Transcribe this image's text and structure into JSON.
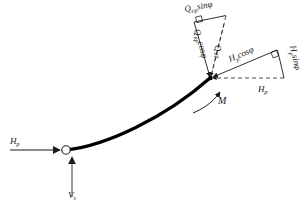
{
  "figure": {
    "type": "free-body-diagram",
    "background_color": "#ffffff",
    "line_color": "#1a1a1a",
    "thin_line_color": "#555555",
    "curve_color": "#000000"
  },
  "labels": {
    "q_tip_sin": {
      "base": "Q",
      "sub": "tip",
      "suffix": "sinφ",
      "full": "Q_tip sinφ"
    },
    "q_tip_cos": {
      "base": "Q",
      "sub": "tip",
      "suffix": "cosφ",
      "full": "Q_tip cosφ"
    },
    "q_tip": {
      "base": "Q",
      "sub": "tip",
      "suffix": "",
      "full": "Q_tip"
    },
    "h_p_cos": {
      "base": "H",
      "sub": "p",
      "suffix": "cosφ",
      "full": "H_p cosφ"
    },
    "h_p_sin": {
      "base": "H",
      "sub": "p",
      "suffix": "sinφ",
      "full": "H_p sinφ"
    },
    "h_p_tip": {
      "base": "H",
      "sub": "p",
      "suffix": "",
      "full": "H_p"
    },
    "h_p_head": {
      "base": "H",
      "sub": "p",
      "suffix": "",
      "full": "H_p"
    },
    "v_s": {
      "base": "V",
      "sub": "s",
      "suffix": "",
      "full": "V_s"
    },
    "moment": {
      "base": "M",
      "sub": "",
      "suffix": "",
      "full": "M"
    }
  },
  "geometry": {
    "pile_head_node": {
      "x": 66,
      "y": 150,
      "marker": "open-circle"
    },
    "pile_tip_node": {
      "x": 210,
      "y": 78,
      "marker": "filled-dot"
    },
    "curve_path": "M 66 150 C 105 146 165 118 210 78",
    "angle_symbol": "φ"
  },
  "vectors": [
    {
      "name": "q-tip-resultant",
      "from": [
        194,
        22
      ],
      "to": [
        210,
        78
      ],
      "style": "solid-thin-arrow"
    },
    {
      "name": "q-tip-vertical-dashed",
      "from": [
        226,
        16
      ],
      "to": [
        210,
        78
      ],
      "style": "dashed"
    },
    {
      "name": "q-tip-sin-horizontal",
      "from": [
        194,
        22
      ],
      "to": [
        226,
        16
      ],
      "style": "solid-thin"
    },
    {
      "name": "h-p-cos-resultant",
      "from": [
        277,
        50
      ],
      "to": [
        210,
        78
      ],
      "style": "solid-thin-arrow"
    },
    {
      "name": "h-p-horizontal-dashed",
      "from": [
        284,
        78
      ],
      "to": [
        210,
        78
      ],
      "style": "dashed"
    },
    {
      "name": "h-p-sin-vertical",
      "from": [
        277,
        50
      ],
      "to": [
        284,
        78
      ],
      "style": "solid-thin"
    },
    {
      "name": "h-p-head-arrow",
      "from": [
        12,
        150
      ],
      "to": [
        64,
        150
      ],
      "style": "solid-thin-arrow"
    },
    {
      "name": "v-s-arrow",
      "from": [
        73,
        196
      ],
      "to": [
        73,
        156
      ],
      "style": "solid-thin-arrow"
    },
    {
      "name": "moment-arc",
      "from": [
        196,
        112
      ],
      "to": [
        222,
        90
      ],
      "style": "curved-arrow"
    }
  ],
  "right_angle_marks": [
    {
      "name": "q-tip-right-angle",
      "x": 196,
      "y": 20
    },
    {
      "name": "h-p-right-angle",
      "x": 272,
      "y": 52
    }
  ]
}
